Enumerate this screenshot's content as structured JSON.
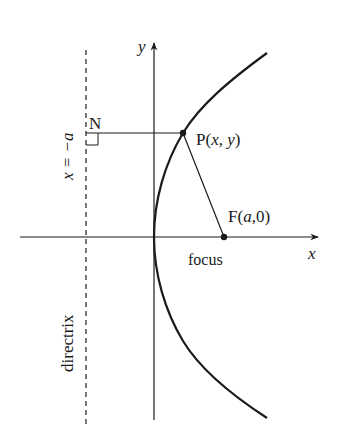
{
  "diagram": {
    "axes": {
      "x_label": "x",
      "y_label": "y"
    },
    "directrix": {
      "equation_label": "x = −a",
      "name_label": "directrix",
      "style": "dashed"
    },
    "points": {
      "N": {
        "label": "N"
      },
      "P": {
        "label_prefix": "P(",
        "var1": "x",
        "sep": ", ",
        "var2": "y",
        "label_suffix": ")"
      },
      "F": {
        "label_prefix": "F(",
        "var1": "a",
        "sep": ",",
        "var2": "0",
        "label_suffix": ")"
      }
    },
    "focus_caption": "focus",
    "colors": {
      "ink": "#1a1a1a",
      "background": "#ffffff"
    }
  }
}
